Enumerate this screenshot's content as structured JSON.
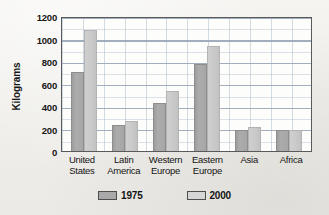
{
  "chart_data": {
    "type": "bar",
    "title": "",
    "xlabel": "",
    "ylabel": "Kilograms",
    "ylim": [
      0,
      1200
    ],
    "ytick_step": 200,
    "yticks": [
      1200,
      1000,
      800,
      600,
      400,
      200,
      0
    ],
    "ytick_labels": [
      "1200",
      "1000",
      "800",
      "600",
      "400",
      "200",
      "0"
    ],
    "grid": true,
    "legend_position": "bottom-center",
    "categories": [
      "United States",
      "Latin America",
      "Western Europe",
      "Eastern Europe",
      "Asia",
      "Africa"
    ],
    "category_lines": [
      [
        "United",
        "States"
      ],
      [
        "Latin",
        "America"
      ],
      [
        "Western",
        "Europe"
      ],
      [
        "Eastern",
        "Europe"
      ],
      [
        "Asia",
        ""
      ],
      [
        "Africa",
        ""
      ]
    ],
    "series": [
      {
        "name": "1975",
        "color": "#a9a9a9",
        "values": [
          720,
          240,
          440,
          790,
          195,
          190
        ]
      },
      {
        "name": "2000",
        "color": "#d0d0d0",
        "values": [
          1100,
          275,
          545,
          955,
          220,
          190
        ]
      }
    ]
  },
  "legend": {
    "items": [
      {
        "label": "1975",
        "swatch": "#a9a9a9"
      },
      {
        "label": "2000",
        "swatch": "#d6d6d6"
      }
    ]
  },
  "colors": {
    "page_background": "#f2f1ee",
    "plot_background": "#fdfdfc",
    "plot_border": "#5a5a5a",
    "gridline": "#b0becd",
    "text": "#141414"
  }
}
